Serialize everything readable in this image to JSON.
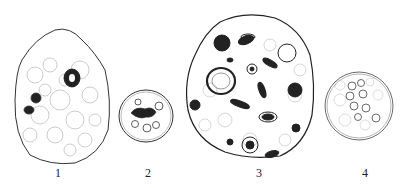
{
  "figure": {
    "panels": [
      {
        "label": "1",
        "description": "large irregular cell with granular cytoplasm and dark inclusions"
      },
      {
        "label": "2",
        "description": "small oval cell with dark nucleus and several vacuoles"
      },
      {
        "label": "3",
        "description": "large rounded cell densely packed with dark inclusions and vacuoles"
      },
      {
        "label": "4",
        "description": "round cell with double membrane and clustered vesicles"
      }
    ]
  }
}
